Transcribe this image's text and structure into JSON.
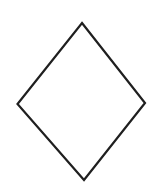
{
  "canvas": {
    "width": 156,
    "height": 190,
    "background_color": "#ffffff"
  },
  "figure": {
    "name": "diamond-outline",
    "shape_type": "quadrilateral",
    "filled": false,
    "fill_color": "none",
    "stroke_color": "#1f1f1f",
    "stroke_width": 2.2,
    "vertices": [
      {
        "label": "top",
        "x": 82.0,
        "y": 23.0
      },
      {
        "label": "right",
        "x": 145.0,
        "y": 103.0
      },
      {
        "label": "bottom",
        "x": 84.0,
        "y": 180.0
      },
      {
        "label": "left",
        "x": 17.5,
        "y": 104.0
      }
    ],
    "points_attr": "82,23 145,103 84,180 17.5,104"
  },
  "labels": {
    "text_present": false,
    "items": []
  }
}
